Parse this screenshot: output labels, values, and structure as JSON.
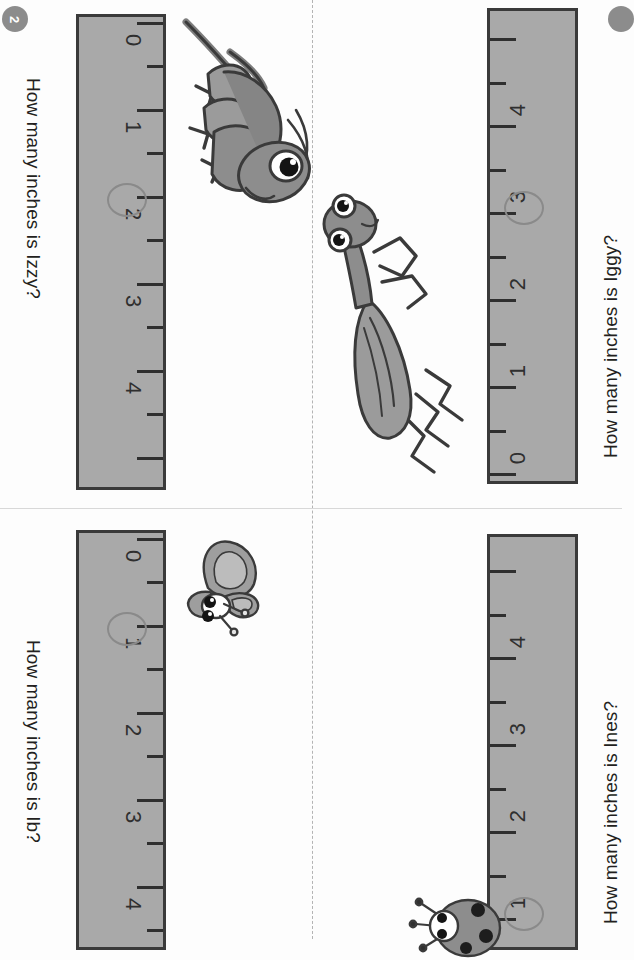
{
  "worksheet": {
    "page_badge": "2",
    "ruler_labels": [
      "0",
      "1",
      "2",
      "3",
      "4"
    ],
    "accent_gray": "#a9a9a9",
    "ink": "#2f2f2f",
    "circle_color": "#8a8a8a",
    "badge_color": "#8c8c8c"
  },
  "panels": [
    {
      "id": "izzy",
      "question": "How many inches is Izzy?",
      "bug": "grasshopper-icon",
      "answer_circled": "2",
      "ticks": [
        "0",
        "1",
        "2",
        "3",
        "4"
      ]
    },
    {
      "id": "iggy",
      "question": "How many inches is Iggy?",
      "bug": "praying-mantis-icon",
      "answer_circled": "3",
      "ticks": [
        "0",
        "1",
        "2",
        "3",
        "4"
      ]
    },
    {
      "id": "ib",
      "question": "How many inches is Ib?",
      "bug": "butterfly-icon",
      "answer_circled": "1",
      "ticks": [
        "0",
        "1",
        "2",
        "3",
        "4"
      ]
    },
    {
      "id": "ines",
      "question": "How many inches is Ines?",
      "bug": "ladybug-icon",
      "answer_circled": "1",
      "ticks": [
        "1",
        "2",
        "3",
        "4"
      ]
    }
  ]
}
